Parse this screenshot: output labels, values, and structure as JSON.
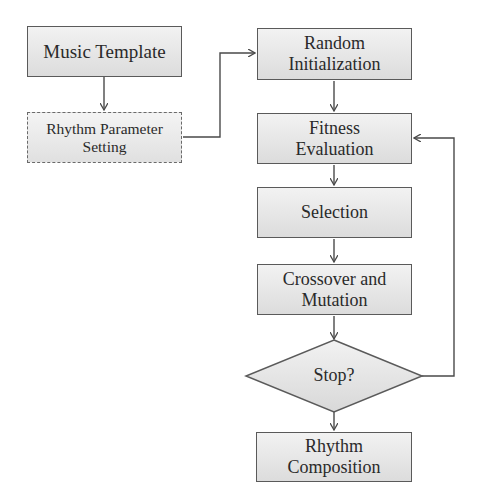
{
  "diagram": {
    "type": "flowchart",
    "nodes": [
      {
        "id": "music_template",
        "label": "Music Template",
        "shape": "rect"
      },
      {
        "id": "rhythm_param",
        "label": "Rhythm Parameter Setting",
        "line1": "Rhythm Parameter",
        "line2": "Setting",
        "shape": "rect-dashed"
      },
      {
        "id": "random_init",
        "label": "Random Initialization",
        "line1": "Random",
        "line2": "Initialization",
        "shape": "rect"
      },
      {
        "id": "fitness",
        "label": "Fitness Evaluation",
        "line1": "Fitness",
        "line2": "Evaluation",
        "shape": "rect"
      },
      {
        "id": "selection",
        "label": "Selection",
        "shape": "rect"
      },
      {
        "id": "crossover",
        "label": "Crossover and Mutation",
        "line1": "Crossover and",
        "line2": "Mutation",
        "shape": "rect"
      },
      {
        "id": "stop",
        "label": "Stop?",
        "shape": "diamond"
      },
      {
        "id": "composition",
        "label": "Rhythm Composition",
        "line1": "Rhythm",
        "line2": "Composition",
        "shape": "rect"
      }
    ],
    "edges": [
      {
        "from": "music_template",
        "to": "rhythm_param"
      },
      {
        "from": "rhythm_param",
        "to": "random_init"
      },
      {
        "from": "random_init",
        "to": "fitness"
      },
      {
        "from": "fitness",
        "to": "selection"
      },
      {
        "from": "selection",
        "to": "crossover"
      },
      {
        "from": "crossover",
        "to": "stop"
      },
      {
        "from": "stop",
        "to": "composition"
      },
      {
        "from": "stop",
        "to": "fitness",
        "note": "loop back"
      }
    ]
  },
  "colors": {
    "line": "#4a4a4a",
    "box_top": "#f2f2f2",
    "box_bottom": "#dcdcdc"
  }
}
